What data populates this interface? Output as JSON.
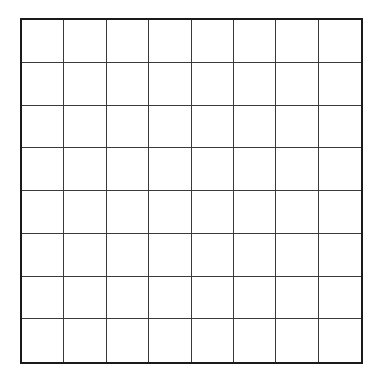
{
  "board": {
    "title": "Othello / Reversi board position",
    "rows": 8,
    "columns": 8,
    "cell_size_px": 42.75,
    "colors": {
      "background": "#ffffff",
      "border": "#1a1a1a",
      "gridline": "#3a3a3a",
      "black_stone": "#000000",
      "white_stone": "#ffffff",
      "white_stone_outline": "#111111"
    },
    "legend": {
      "black_label": "black",
      "white_label": "white",
      "empty_label": "empty"
    },
    "counts": {
      "black": 14,
      "white": 8,
      "empty": 42
    },
    "grid": [
      [
        "empty",
        "empty",
        "empty",
        "empty",
        "empty",
        "empty",
        "empty",
        "empty"
      ],
      [
        "empty",
        "empty",
        "empty",
        "empty",
        "empty",
        "empty",
        "empty",
        "empty"
      ],
      [
        "empty",
        "empty",
        "white",
        "black",
        "black",
        "empty",
        "empty",
        "white"
      ],
      [
        "empty",
        "black",
        "black",
        "black",
        "black",
        "black",
        "white",
        "empty"
      ],
      [
        "empty",
        "empty",
        "white",
        "black",
        "black",
        "black",
        "black",
        "empty"
      ],
      [
        "empty",
        "empty",
        "white",
        "white",
        "white",
        "white",
        "empty",
        "empty"
      ],
      [
        "empty",
        "empty",
        "empty",
        "empty",
        "empty",
        "empty",
        "empty",
        "empty"
      ],
      [
        "empty",
        "empty",
        "empty",
        "empty",
        "empty",
        "empty",
        "empty",
        "empty"
      ]
    ]
  }
}
